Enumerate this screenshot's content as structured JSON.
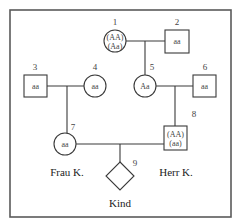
{
  "diagram": {
    "type": "pedigree",
    "individuals": [
      {
        "id": "1",
        "sex": "female",
        "genotype_lines": [
          "(AA)",
          "(Aa)"
        ]
      },
      {
        "id": "2",
        "sex": "male",
        "genotype_lines": [
          "aa"
        ]
      },
      {
        "id": "3",
        "sex": "male",
        "genotype_lines": [
          "aa"
        ]
      },
      {
        "id": "4",
        "sex": "female",
        "genotype_lines": [
          "aa"
        ]
      },
      {
        "id": "5",
        "sex": "female",
        "genotype_lines": [
          "Aa"
        ]
      },
      {
        "id": "6",
        "sex": "male",
        "genotype_lines": [
          "aa"
        ]
      },
      {
        "id": "7",
        "sex": "female",
        "genotype_lines": [
          "aa"
        ],
        "name": "Frau K."
      },
      {
        "id": "8",
        "sex": "male",
        "genotype_lines": [
          "(AA)",
          "(aa)"
        ],
        "name": "Herr K."
      },
      {
        "id": "9",
        "sex": "unknown",
        "genotype_lines": [],
        "name": "Kind"
      }
    ],
    "matings": [
      {
        "partners": [
          "1",
          "2"
        ],
        "children": [
          "5"
        ]
      },
      {
        "partners": [
          "3",
          "4"
        ],
        "children": [
          "7"
        ]
      },
      {
        "partners": [
          "5",
          "6"
        ],
        "children": [
          "8"
        ]
      },
      {
        "partners": [
          "7",
          "8"
        ],
        "children": [
          "9"
        ]
      }
    ]
  }
}
